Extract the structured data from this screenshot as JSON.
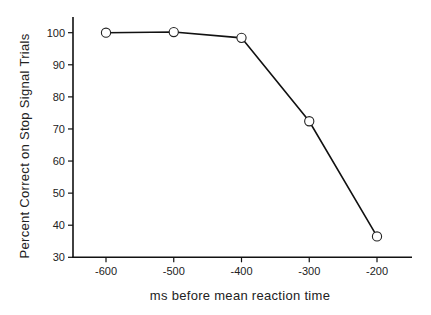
{
  "chart_data": {
    "type": "line",
    "title": "",
    "xlabel": "ms before mean reaction time",
    "ylabel": "Percent Correct on Stop Signal Trials",
    "x": [
      -600,
      -500,
      -400,
      -300,
      -200
    ],
    "series": [
      {
        "name": "Percent correct",
        "values": [
          100,
          100.2,
          98.4,
          72.4,
          36.5
        ]
      }
    ],
    "xticks": [
      -600,
      -500,
      -400,
      -300,
      -200
    ],
    "xtick_labels": [
      "-600",
      "-500",
      "-400",
      "-300",
      "-200"
    ],
    "yticks": [
      30,
      40,
      50,
      60,
      70,
      80,
      90,
      100
    ],
    "ytick_labels": [
      "30",
      "40",
      "50",
      "60",
      "70",
      "80",
      "90",
      "100"
    ],
    "xlim": [
      -650,
      -145
    ],
    "ylim": [
      30,
      104.5
    ],
    "grid": false,
    "legend": "none",
    "marker": "open-circle",
    "line_color": "#111111"
  }
}
